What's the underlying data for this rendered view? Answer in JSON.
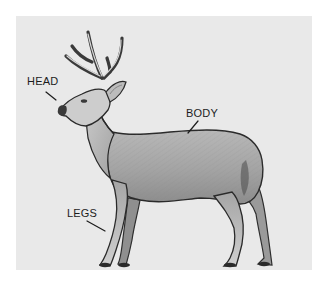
{
  "diagram": {
    "labels": [
      {
        "id": "head",
        "text": "HEAD"
      },
      {
        "id": "body",
        "text": "BODY"
      },
      {
        "id": "legs",
        "text": "LEGS"
      }
    ]
  },
  "colors": {
    "background": "#ffffff",
    "panel": "#e9e9e9",
    "outline": "#2a2a2a",
    "fur_light": "#bdbdbd",
    "fur_mid": "#9a9a9a",
    "fur_dark": "#6e6e6e",
    "label_text": "#1c1c1c"
  }
}
